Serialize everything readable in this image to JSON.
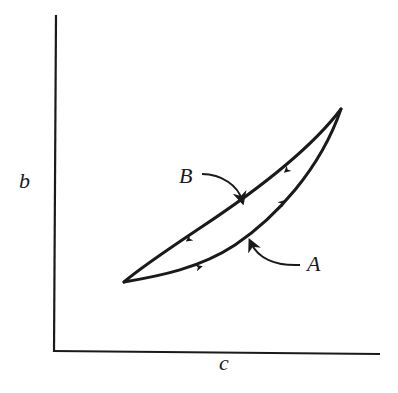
{
  "diagram": {
    "type": "hysteresis-loop",
    "axes": {
      "y_label": "b",
      "x_label": "c"
    },
    "paths": [
      {
        "id": "A",
        "label": "A",
        "direction": "increasing (lower branch, bottom-left to top-right)"
      },
      {
        "id": "B",
        "label": "B",
        "direction": "decreasing (upper branch, top-right to bottom-left)"
      }
    ],
    "colors": {
      "stroke": "#1a1a1a",
      "background": "#ffffff"
    }
  }
}
